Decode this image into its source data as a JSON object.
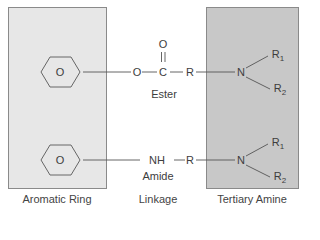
{
  "diagram": {
    "panels": {
      "left": {
        "label": "Aromatic Ring",
        "fill": "#e7e7e7"
      },
      "middle": {
        "label": "Linkage"
      },
      "right": {
        "label": "Tertiary Amine",
        "fill": "#c8c8c8"
      }
    },
    "ester_row": {
      "ring_symbol": "O",
      "oxygen": "O",
      "carbonyl_oxygen": "O",
      "carbon": "C",
      "r_group": "R",
      "nitrogen": "N",
      "substituent_1": "R",
      "substituent_1_sub": "1",
      "substituent_2": "R",
      "substituent_2_sub": "2",
      "linkage_name": "Ester"
    },
    "amide_row": {
      "ring_symbol": "O",
      "nh": "NH",
      "r_group": "R",
      "nitrogen": "N",
      "substituent_1": "R",
      "substituent_1_sub": "1",
      "substituent_2": "R",
      "substituent_2_sub": "2",
      "linkage_name": "Amide"
    },
    "colors": {
      "line": "#555555",
      "border": "#8a8a8a",
      "text": "#3d3d3d"
    }
  }
}
